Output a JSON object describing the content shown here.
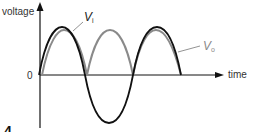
{
  "diagram": {
    "y_axis_label": "voltage",
    "x_axis_label": "time",
    "origin_label": "0",
    "figure_number": "4",
    "series": [
      {
        "name": "input",
        "label_main": "V",
        "label_sub": "i",
        "color": "#111111",
        "shape": "full sine wave"
      },
      {
        "name": "output",
        "label_main": "V",
        "label_sub": "o",
        "color": "#8a8a8a",
        "shape": "full-wave rectified sine"
      }
    ],
    "colors": {
      "axis": "#111111",
      "text": "#333333"
    }
  }
}
